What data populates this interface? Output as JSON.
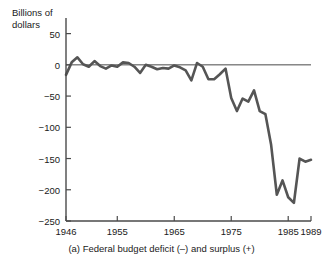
{
  "chart_data": {
    "type": "line",
    "title": "",
    "caption": "(a) Federal budget deficit (–) and surplus (+)",
    "ylabel": "Billions of\ndollars",
    "xlabel": "",
    "ylim": [
      -250,
      75
    ],
    "xlim": [
      1946,
      1989
    ],
    "grid": false,
    "legend": "none",
    "yticks": [
      50,
      0,
      -50,
      -100,
      -150,
      -200,
      -250
    ],
    "ytick_labels": [
      "50",
      "0",
      "−50",
      "−100",
      "−150",
      "−200",
      "−250"
    ],
    "xticks": [
      1946,
      1955,
      1965,
      1975,
      1985,
      1989
    ],
    "xtick_labels": [
      "1946",
      "1955",
      "1965",
      "1975",
      "1985",
      "1989"
    ],
    "zero_line": 0,
    "line_color": "#555555",
    "axis_color": "#4a4a4a",
    "series": [
      {
        "name": "Federal budget surplus/deficit",
        "units": "Billions of dollars",
        "x": [
          1946,
          1947,
          1948,
          1949,
          1950,
          1951,
          1952,
          1953,
          1954,
          1955,
          1956,
          1957,
          1958,
          1959,
          1960,
          1961,
          1962,
          1963,
          1964,
          1965,
          1966,
          1967,
          1968,
          1969,
          1970,
          1971,
          1972,
          1973,
          1974,
          1975,
          1976,
          1977,
          1978,
          1979,
          1980,
          1981,
          1982,
          1983,
          1984,
          1985,
          1986,
          1987,
          1988,
          1989
        ],
        "values": [
          -16,
          4,
          12,
          1,
          -3,
          6,
          -2,
          -6,
          -1,
          -3,
          4,
          3,
          -3,
          -13,
          0,
          -3,
          -7,
          -5,
          -6,
          -1,
          -4,
          -9,
          -25,
          3,
          -3,
          -23,
          -23,
          -15,
          -6,
          -53,
          -74,
          -54,
          -59,
          -41,
          -74,
          -79,
          -128,
          -208,
          -185,
          -212,
          -221,
          -150,
          -155,
          -152
        ]
      }
    ]
  }
}
